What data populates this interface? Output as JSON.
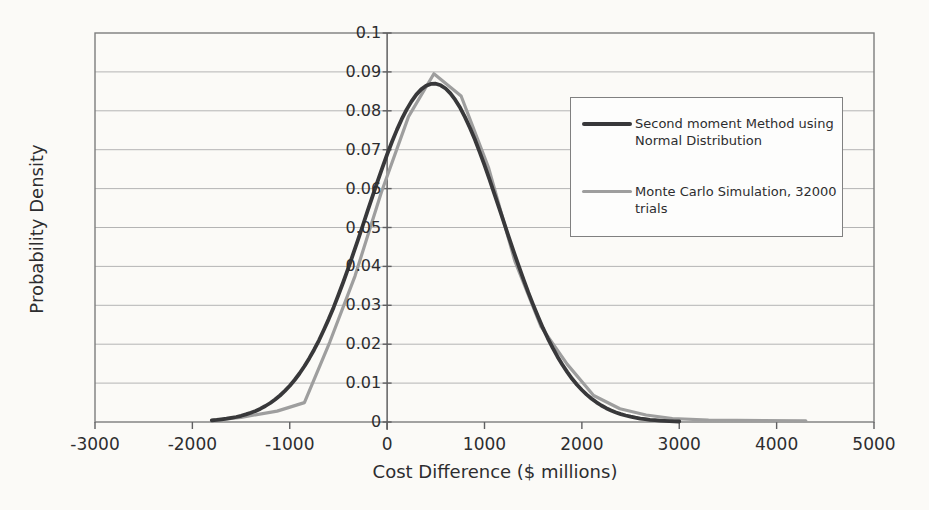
{
  "page": {
    "background_color": "#fbfaf7",
    "text_color": "#2d2d2f"
  },
  "chart_data": {
    "type": "line",
    "title": "",
    "xlabel": "Cost Difference ($ millions)",
    "ylabel": "Probability Density",
    "xlim": [
      -3000,
      5000
    ],
    "ylim": [
      0,
      0.1
    ],
    "x_ticks": [
      -3000,
      -2000,
      -1000,
      0,
      1000,
      2000,
      3000,
      4000,
      5000
    ],
    "y_ticks": [
      0.1,
      0.09,
      0.08,
      0.07,
      0.06,
      0.05,
      0.04,
      0.03,
      0.02,
      0.01,
      0
    ],
    "grid": "horizontal gridlines every 0.01, value axis drawn at x=0",
    "legend_position": "inside upper right",
    "series": [
      {
        "name": "Second moment Method using Normal Distribution",
        "type": "gaussian_curve",
        "color": "#38383a",
        "stroke_width": 3.8,
        "mean": 480,
        "sigma": 700,
        "peak_density": 0.087,
        "x_range": [
          -1800,
          3000
        ]
      },
      {
        "name": "Monte Carlo Simulation, 32000 trials",
        "type": "polyline",
        "color": "#9e9e9e",
        "stroke_width": 3.2,
        "points": [
          [
            -1800,
            0.0004
          ],
          [
            -1500,
            0.0012
          ],
          [
            -1130,
            0.0028
          ],
          [
            -850,
            0.005
          ],
          [
            -590,
            0.0205
          ],
          [
            -330,
            0.0375
          ],
          [
            -60,
            0.059
          ],
          [
            220,
            0.0785
          ],
          [
            480,
            0.0895
          ],
          [
            760,
            0.0838
          ],
          [
            1040,
            0.0655
          ],
          [
            1310,
            0.0415
          ],
          [
            1580,
            0.0245
          ],
          [
            1850,
            0.0148
          ],
          [
            2120,
            0.0068
          ],
          [
            2390,
            0.0034
          ],
          [
            2660,
            0.0018
          ],
          [
            2930,
            0.0009
          ],
          [
            3300,
            0.0005
          ],
          [
            4300,
            0.0003
          ]
        ]
      }
    ]
  },
  "colors": {
    "grid_line": "#b4b4b4",
    "axis_line": "#5f5f61",
    "plot_border": "#7d7d7d",
    "legend_border": "#808080",
    "legend_background": "#fdfdfc"
  },
  "layout_note_visible_elements": "plot area with border, horizontal gridlines, value axis at x=0 with tick marks, x axis with tick marks, legend box with two line-series entries"
}
